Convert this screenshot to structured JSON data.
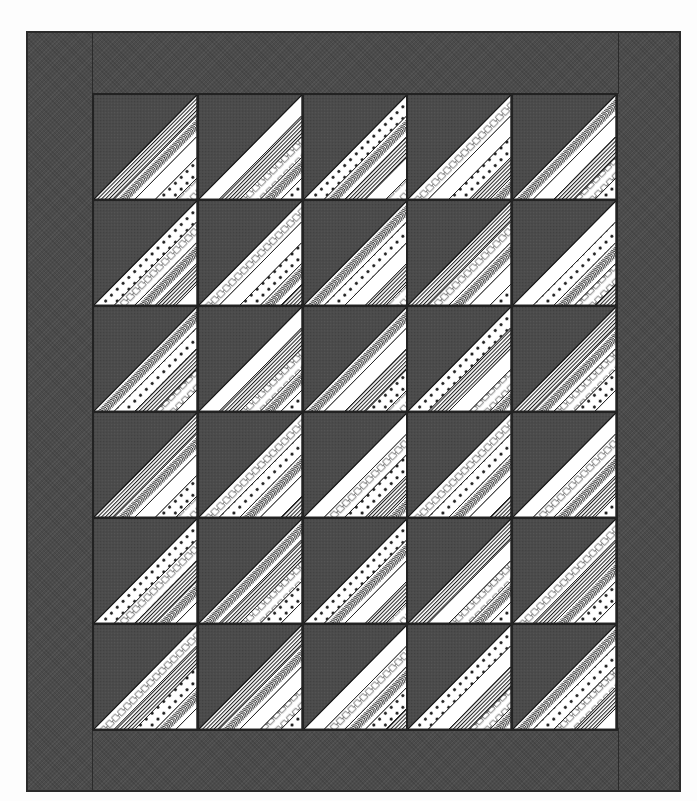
{
  "image": {
    "subject": "Quilt with half-square triangle blocks",
    "layout": {
      "rows": 6,
      "columns": 5
    },
    "colors": {
      "background_paper": "#fdfdfd",
      "dark_fabric": "#4b4b4b",
      "seam": "#222222",
      "light_fabric": "#ffffff",
      "print_ink": "#1e1e1e"
    },
    "border": {
      "pieces": [
        "left",
        "right",
        "top",
        "bottom"
      ],
      "description": "Dark solid border; side strips run full height, top and bottom strips between them"
    },
    "block_description": "Each block: upper-left dark triangle; lower-right triangle pieced from 5 diagonal strips of black-and-white prints",
    "print_types": [
      "lines",
      "chevron",
      "dots",
      "zigzag",
      "plain"
    ],
    "blocks": [
      [
        [
          "lines",
          "chevron",
          "plain",
          "dots",
          "zigzag"
        ],
        [
          "plain",
          "lines",
          "zigzag",
          "chevron",
          "dots"
        ],
        [
          "dots",
          "chevron",
          "lines",
          "plain",
          "zigzag"
        ],
        [
          "zigzag",
          "plain",
          "dots",
          "lines",
          "chevron"
        ],
        [
          "chevron",
          "plain",
          "lines",
          "zigzag",
          "dots"
        ]
      ],
      [
        [
          "dots",
          "zigzag",
          "chevron",
          "lines",
          "plain"
        ],
        [
          "zigzag",
          "plain",
          "dots",
          "chevron",
          "lines"
        ],
        [
          "chevron",
          "dots",
          "plain",
          "lines",
          "zigzag"
        ],
        [
          "lines",
          "zigzag",
          "chevron",
          "plain",
          "dots"
        ],
        [
          "plain",
          "dots",
          "chevron",
          "zigzag",
          "lines"
        ]
      ],
      [
        [
          "chevron",
          "dots",
          "lines",
          "zigzag",
          "plain"
        ],
        [
          "plain",
          "lines",
          "zigzag",
          "chevron",
          "dots"
        ],
        [
          "chevron",
          "plain",
          "lines",
          "dots",
          "zigzag"
        ],
        [
          "dots",
          "lines",
          "plain",
          "zigzag",
          "chevron"
        ],
        [
          "lines",
          "chevron",
          "zigzag",
          "dots",
          "plain"
        ]
      ],
      [
        [
          "lines",
          "chevron",
          "plain",
          "dots",
          "zigzag"
        ],
        [
          "zigzag",
          "dots",
          "chevron",
          "plain",
          "lines"
        ],
        [
          "plain",
          "zigzag",
          "dots",
          "lines",
          "chevron"
        ],
        [
          "zigzag",
          "dots",
          "chevron",
          "plain",
          "lines"
        ],
        [
          "plain",
          "zigzag",
          "chevron",
          "lines",
          "dots"
        ]
      ],
      [
        [
          "dots",
          "zigzag",
          "lines",
          "chevron",
          "plain"
        ],
        [
          "chevron",
          "lines",
          "zigzag",
          "dots",
          "plain"
        ],
        [
          "dots",
          "chevron",
          "plain",
          "lines",
          "zigzag"
        ],
        [
          "lines",
          "plain",
          "zigzag",
          "chevron",
          "dots"
        ],
        [
          "zigzag",
          "lines",
          "chevron",
          "dots",
          "plain"
        ]
      ],
      [
        [
          "zigzag",
          "lines",
          "dots",
          "chevron",
          "plain"
        ],
        [
          "lines",
          "chevron",
          "plain",
          "zigzag",
          "dots"
        ],
        [
          "plain",
          "zigzag",
          "chevron",
          "dots",
          "lines"
        ],
        [
          "dots",
          "plain",
          "lines",
          "zigzag",
          "chevron"
        ],
        [
          "chevron",
          "dots",
          "zigzag",
          "lines",
          "plain"
        ]
      ]
    ]
  }
}
